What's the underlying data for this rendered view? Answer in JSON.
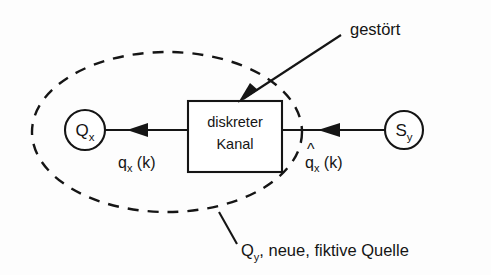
{
  "diagram": {
    "background_color": "#fdfdfd",
    "line_color": "#151515",
    "source_node": {
      "label": "Q",
      "subscript": "x",
      "name": "source-node"
    },
    "sink_node": {
      "label": "S",
      "subscript": "y",
      "name": "sink-node"
    },
    "channel_box": {
      "line1": "diskreter",
      "line2": "Kanal"
    },
    "input_signal": {
      "base": "q",
      "subscript": "x",
      "argument": "(k)"
    },
    "output_signal": {
      "hat": "^",
      "base": "q",
      "subscript": "x",
      "argument": "(k)"
    },
    "disturbance_annotation": "gestört",
    "boundary_caption": {
      "symbol": "Q",
      "subscript": "y",
      "rest": ", neue, fiktive Quelle"
    }
  }
}
